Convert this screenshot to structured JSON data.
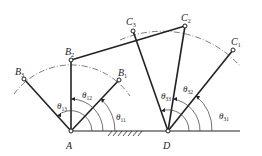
{
  "diagram": {
    "type": "four-bar linkage, three positions",
    "colors": {
      "line": "#222222",
      "background": "#ffffff"
    },
    "fixed_pivots": {
      "A": {
        "label": "A",
        "x": 71,
        "y": 131
      },
      "D": {
        "label": "D",
        "x": 168,
        "y": 131
      }
    },
    "crank_points": [
      {
        "label": "B",
        "sub": "1",
        "x": 119,
        "y": 80
      },
      {
        "label": "B",
        "sub": "2",
        "x": 71,
        "y": 60
      },
      {
        "label": "B",
        "sub": "3",
        "x": 24,
        "y": 79
      }
    ],
    "rocker_points": [
      {
        "label": "C",
        "sub": "1",
        "x": 233,
        "y": 50
      },
      {
        "label": "C",
        "sub": "2",
        "x": 185,
        "y": 26
      },
      {
        "label": "C",
        "sub": "3",
        "x": 133,
        "y": 31
      }
    ],
    "angles": [
      {
        "label": "θ",
        "sub": "11"
      },
      {
        "label": "θ",
        "sub": "12"
      },
      {
        "label": "θ",
        "sub": "13"
      },
      {
        "label": "θ",
        "sub": "31"
      },
      {
        "label": "θ",
        "sub": "32"
      },
      {
        "label": "θ",
        "sub": "33"
      }
    ]
  }
}
